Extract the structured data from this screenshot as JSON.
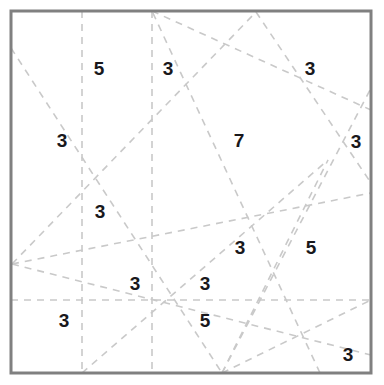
{
  "figure": {
    "name": "dashed-line-arrangement-region-counts",
    "width": 384,
    "height": 385,
    "background_color": "#ffffff",
    "border": {
      "color": "#808080",
      "width_px": 3,
      "x": 11,
      "y": 11,
      "right": 371,
      "bottom": 373
    },
    "line_style": {
      "color": "#c9c9c9",
      "width_px": 1.6,
      "dash": "7 6"
    }
  },
  "chart_data": {
    "type": "diagram",
    "title": "",
    "xlabel": "",
    "ylabel": "",
    "frame": {
      "x0": 11,
      "y0": 11,
      "x1": 371,
      "y1": 373
    },
    "lines": [
      {
        "id": "v1",
        "kind": "vertical",
        "x1": 82,
        "y1": 11,
        "x2": 82,
        "y2": 373
      },
      {
        "id": "v2",
        "kind": "vertical",
        "x1": 152,
        "y1": 11,
        "x2": 152,
        "y2": 373
      },
      {
        "id": "h1",
        "kind": "horizontal",
        "x1": 11,
        "y1": 300,
        "x2": 371,
        "y2": 300
      },
      {
        "id": "d1",
        "kind": "diagonal",
        "x1": 11,
        "y1": 48,
        "x2": 222,
        "y2": 373
      },
      {
        "id": "d2",
        "kind": "diagonal",
        "x1": 12,
        "y1": 264,
        "x2": 256,
        "y2": 12
      },
      {
        "id": "d3",
        "kind": "diagonal",
        "x1": 12,
        "y1": 264,
        "x2": 371,
        "y2": 193
      },
      {
        "id": "d4",
        "kind": "diagonal",
        "x1": 12,
        "y1": 264,
        "x2": 371,
        "y2": 355
      },
      {
        "id": "d5",
        "kind": "diagonal",
        "x1": 256,
        "y1": 12,
        "x2": 371,
        "y2": 183
      },
      {
        "id": "d6",
        "kind": "diagonal",
        "x1": 152,
        "y1": 11,
        "x2": 371,
        "y2": 110
      },
      {
        "id": "d7",
        "kind": "diagonal",
        "x1": 222,
        "y1": 373,
        "x2": 371,
        "y2": 88
      },
      {
        "id": "d8",
        "kind": "diagonal",
        "x1": 222,
        "y1": 373,
        "x2": 328,
        "y2": 160
      },
      {
        "id": "d9",
        "kind": "diagonal",
        "x1": 222,
        "y1": 373,
        "x2": 371,
        "y2": 300
      },
      {
        "id": "d10",
        "kind": "diagonal",
        "x1": 320,
        "y1": 373,
        "x2": 152,
        "y2": 11
      },
      {
        "id": "d11",
        "kind": "diagonal",
        "x1": 82,
        "y1": 373,
        "x2": 328,
        "y2": 160
      }
    ],
    "region_labels": [
      {
        "value": "5",
        "x": 99,
        "y": 68
      },
      {
        "value": "3",
        "x": 168,
        "y": 68
      },
      {
        "value": "3",
        "x": 310,
        "y": 68
      },
      {
        "value": "3",
        "x": 62,
        "y": 140
      },
      {
        "value": "7",
        "x": 239,
        "y": 140
      },
      {
        "value": "3",
        "x": 356,
        "y": 141
      },
      {
        "value": "3",
        "x": 100,
        "y": 211
      },
      {
        "value": "3",
        "x": 240,
        "y": 247
      },
      {
        "value": "5",
        "x": 311,
        "y": 247
      },
      {
        "value": "3",
        "x": 135,
        "y": 283
      },
      {
        "value": "3",
        "x": 205,
        "y": 283
      },
      {
        "value": "3",
        "x": 64,
        "y": 320
      },
      {
        "value": "5",
        "x": 205,
        "y": 320
      },
      {
        "value": "3",
        "x": 348,
        "y": 354
      }
    ],
    "values": [
      5,
      3,
      3,
      3,
      7,
      3,
      3,
      3,
      5,
      3,
      3,
      3,
      5,
      3
    ]
  }
}
